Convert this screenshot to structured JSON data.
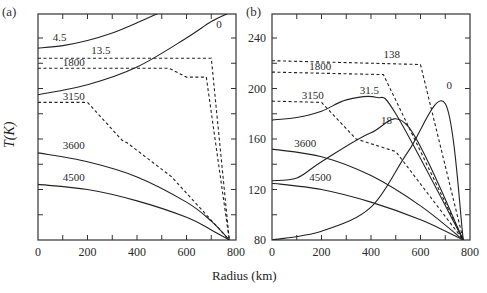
{
  "figure": {
    "xlabel": "Radius (km)",
    "ylabel": "T(K)",
    "panel_a_label": "(a)",
    "panel_b_label": "(b)",
    "x_ticks": [
      "0",
      "200",
      "400",
      "600",
      "800"
    ],
    "y_ticks_b": [
      "80",
      "120",
      "160",
      "200",
      "240"
    ]
  },
  "chart_data": [
    {
      "type": "line",
      "panel": "(a)",
      "title": "",
      "xlabel": "Radius (km)",
      "ylabel": "T(K)",
      "xlim": [
        0,
        800
      ],
      "ylim": [
        80,
        260
      ],
      "x_tick_labels": [
        "0",
        "200",
        "400",
        "600",
        "800"
      ],
      "y_tick_labels": [],
      "grid": false,
      "series": [
        {
          "name": "0",
          "style": "solid",
          "x": [
            0,
            200,
            400,
            600,
            700,
            773
          ],
          "y": [
            195,
            203,
            217,
            240,
            253,
            260
          ]
        },
        {
          "name": "4.5",
          "style": "solid",
          "x": [
            0,
            100,
            200,
            300,
            400,
            490
          ],
          "y": [
            232,
            234,
            238,
            244,
            252,
            260
          ]
        },
        {
          "name": "13.5",
          "style": "dashed",
          "x": [
            0,
            490,
            550,
            700,
            773
          ],
          "y": [
            224,
            224,
            224,
            224,
            80
          ]
        },
        {
          "name": "1800",
          "style": "dashed",
          "x": [
            0,
            450,
            530,
            600,
            680,
            773
          ],
          "y": [
            216,
            216,
            216,
            209,
            209,
            80
          ]
        },
        {
          "name": "3150",
          "style": "dashed",
          "x": [
            0,
            200,
            340,
            360,
            540,
            773
          ],
          "y": [
            189,
            189,
            159,
            157,
            130,
            80
          ]
        },
        {
          "name": "3600",
          "style": "solid",
          "x": [
            0,
            200,
            400,
            600,
            700,
            773
          ],
          "y": [
            149,
            142,
            130,
            110,
            95,
            80
          ]
        },
        {
          "name": "4500",
          "style": "solid",
          "x": [
            0,
            200,
            400,
            600,
            700,
            773
          ],
          "y": [
            124,
            120,
            111,
            98,
            88,
            80
          ]
        }
      ]
    },
    {
      "type": "line",
      "panel": "(b)",
      "title": "",
      "xlabel": "Radius (km)",
      "ylabel": "T(K)",
      "xlim": [
        0,
        800
      ],
      "ylim": [
        80,
        260
      ],
      "x_tick_labels": [
        "0",
        "200",
        "400",
        "600",
        "800"
      ],
      "y_tick_labels": [
        "80",
        "120",
        "160",
        "200",
        "240"
      ],
      "grid": false,
      "series": [
        {
          "name": "0",
          "style": "solid",
          "x": [
            0,
            200,
            400,
            550,
            700,
            773
          ],
          "y": [
            80,
            87,
            106,
            150,
            188,
            80
          ]
        },
        {
          "name": "18",
          "style": "solid",
          "x": [
            0,
            100,
            200,
            400,
            550,
            773
          ],
          "y": [
            127,
            129,
            142,
            165,
            170,
            80
          ]
        },
        {
          "name": "31.5",
          "style": "solid",
          "x": [
            0,
            100,
            200,
            300,
            420,
            500,
            773
          ],
          "y": [
            175,
            177,
            182,
            191,
            193,
            180,
            80
          ]
        },
        {
          "name": "138",
          "style": "dashed",
          "x": [
            0,
            600,
            773
          ],
          "y": [
            222,
            219,
            80
          ]
        },
        {
          "name": "1800",
          "style": "dashed",
          "x": [
            0,
            450,
            773
          ],
          "y": [
            213,
            211,
            80
          ]
        },
        {
          "name": "3150",
          "style": "dashed",
          "x": [
            0,
            200,
            340,
            500,
            773
          ],
          "y": [
            190,
            189,
            160,
            150,
            80
          ]
        },
        {
          "name": "3600",
          "style": "solid",
          "x": [
            0,
            200,
            400,
            600,
            773
          ],
          "y": [
            152,
            146,
            131,
            107,
            80
          ]
        },
        {
          "name": "4500",
          "style": "solid",
          "x": [
            0,
            200,
            400,
            600,
            773
          ],
          "y": [
            125,
            120,
            110,
            96,
            80
          ]
        }
      ]
    }
  ]
}
